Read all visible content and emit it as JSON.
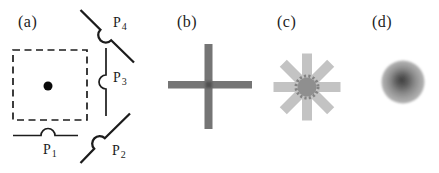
{
  "figure": {
    "panels": [
      {
        "label": "(a)"
      },
      {
        "label": "(b)"
      },
      {
        "label": "(c)"
      },
      {
        "label": "(d)"
      }
    ],
    "panel_a": {
      "probes": [
        {
          "symbol": "P",
          "index": "1"
        },
        {
          "symbol": "P",
          "index": "2"
        },
        {
          "symbol": "P",
          "index": "3"
        },
        {
          "symbol": "P",
          "index": "4"
        }
      ]
    },
    "colors": {
      "ink": "#1c1c1c",
      "dot_black": "#0a0a0a",
      "cross_gray": "#747474",
      "cross_center_gray": "#4e4e4e",
      "star_arm_gray": "#c3c3c3",
      "star_core_gray": "#8f8f8f",
      "star_spike_gray": "#838383",
      "blob_center_gray": "#3f3f3f",
      "blob_mid_gray": "#8b8b8b",
      "blob_edge_gray": "#b4b4b4"
    }
  }
}
